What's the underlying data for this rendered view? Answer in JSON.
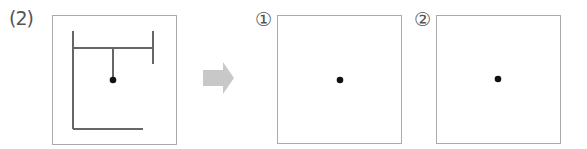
{
  "problem": {
    "label": "(2)",
    "figure": {
      "description": "room with walls and a pendant light",
      "stroke_color": "#666666",
      "dot_color": "#111111"
    }
  },
  "arrow": {
    "color": "#c8c8c8",
    "direction": "right"
  },
  "answer_boxes": [
    {
      "label": "①",
      "content": "center dot"
    },
    {
      "label": "②",
      "content": "center dot"
    }
  ]
}
